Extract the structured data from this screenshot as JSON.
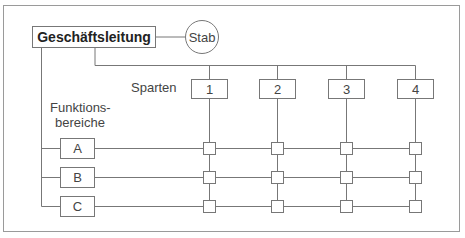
{
  "diagram": {
    "type": "matrix-organization-chart",
    "leadership": {
      "label": "Geschäftsleitung"
    },
    "staff": {
      "label": "Stab"
    },
    "divisions_label": "Sparten",
    "functions_label_line1": "Funktions-",
    "functions_label_line2": "bereiche",
    "divisions": [
      {
        "label": "1"
      },
      {
        "label": "2"
      },
      {
        "label": "3"
      },
      {
        "label": "4"
      }
    ],
    "functions": [
      {
        "label": "A"
      },
      {
        "label": "B"
      },
      {
        "label": "C"
      }
    ],
    "colors": {
      "line": "#777777",
      "frame": "#9a9a9a",
      "text": "#444444",
      "background": "#ffffff"
    }
  }
}
